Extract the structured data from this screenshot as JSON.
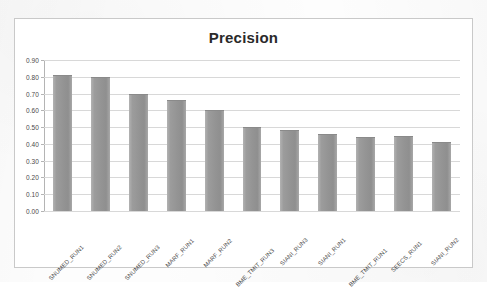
{
  "chart_data": {
    "type": "bar",
    "title": "Precision",
    "xlabel": "",
    "ylabel": "",
    "ylim": [
      0.0,
      0.9
    ],
    "grid": true,
    "legend": "none",
    "orientation": "vertical",
    "ytick_labels": [
      "0.90",
      "0.80",
      "0.70",
      "0.60",
      "0.50",
      "0.40",
      "0.30",
      "0.20",
      "0.10",
      "0.00"
    ],
    "ytick_values": [
      0.9,
      0.8,
      0.7,
      0.6,
      0.5,
      0.4,
      0.3,
      0.2,
      0.1,
      0.0
    ],
    "categories": [
      "SNUMED_RUN1",
      "SNUMED_RUN2",
      "SNUMED_RUN3",
      "MARF_RUN1",
      "MARF_RUN2",
      "BME_TMIT_RUN3",
      "SIANI_RUN3",
      "SIANI_RUN1",
      "BME_TMIT_RUN1",
      "SEECS_RUN1",
      "SIANI_RUN2"
    ],
    "values": [
      0.81,
      0.8,
      0.7,
      0.66,
      0.6,
      0.5,
      0.48,
      0.46,
      0.44,
      0.445,
      0.41
    ],
    "series": [
      {
        "name": "Precision",
        "values": [
          0.81,
          0.8,
          0.7,
          0.66,
          0.6,
          0.5,
          0.48,
          0.46,
          0.44,
          0.445,
          0.41
        ]
      }
    ],
    "colors": {
      "bar": "#969696",
      "gridline": "#d8d8d8",
      "axis": "#b4b4b4",
      "title": "#2a2a2a",
      "tick_text": "#4a4a4a",
      "frame": "#c9c9c9",
      "plot_background": "#ffffff"
    }
  }
}
